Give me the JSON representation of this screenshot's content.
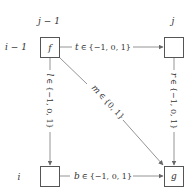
{
  "diagram": {
    "column_labels": [
      {
        "text": "j − 1"
      },
      {
        "text": "j"
      }
    ],
    "row_labels": [
      {
        "text": "i − 1"
      },
      {
        "text": "i"
      }
    ],
    "nodes": [
      {
        "id": "f",
        "label": "f"
      },
      {
        "id": "top_right",
        "label": ""
      },
      {
        "id": "bottom_left",
        "label": ""
      },
      {
        "id": "g",
        "label": "g"
      }
    ],
    "edges": [
      {
        "id": "t",
        "var": "t",
        "rel": "∈",
        "set": "{−1, 0, 1}"
      },
      {
        "id": "l",
        "var": "l",
        "rel": "∈",
        "set": "{−1, 0, 1}"
      },
      {
        "id": "m",
        "var": "m",
        "rel": "∈",
        "set": "{0, 1}"
      },
      {
        "id": "r",
        "var": "r",
        "rel": "∈",
        "set": "{−1, 0, 1}"
      },
      {
        "id": "b",
        "var": "b",
        "rel": "∈",
        "set": "{−1, 0, 1}"
      }
    ],
    "colors": {
      "box_stroke": "#555555",
      "edge": "#888888",
      "text": "#333333"
    }
  }
}
